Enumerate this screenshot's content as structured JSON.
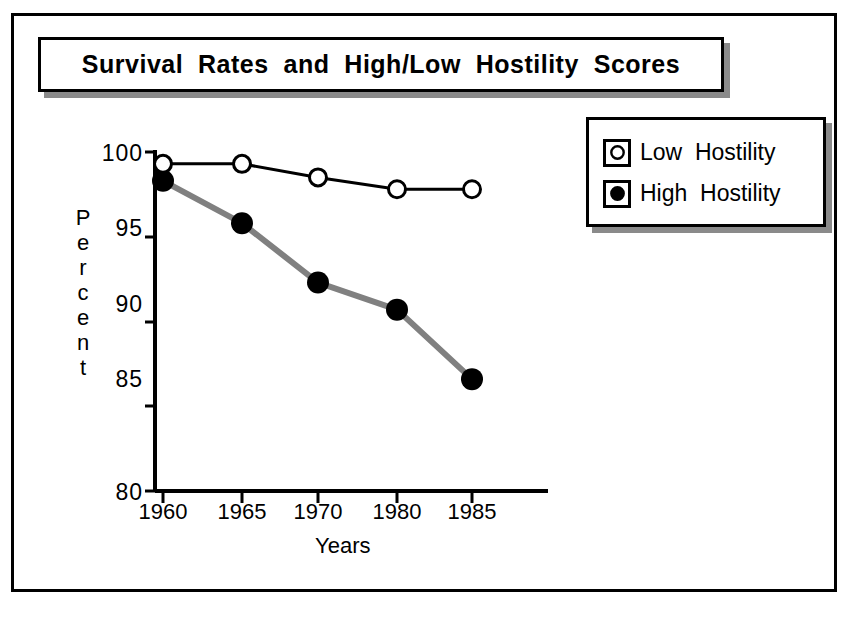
{
  "title": "Survival  Rates  and  High/Low  Hostility  Scores",
  "legend": {
    "items": [
      {
        "label": "Low  Hostility",
        "marker": "open-circle",
        "icon": "open-circle-icon"
      },
      {
        "label": "High  Hostility",
        "marker": "filled-circle",
        "icon": "filled-circle-icon"
      }
    ]
  },
  "axes": {
    "ylabel_letters": [
      "P",
      "e",
      "r",
      "c",
      "e",
      "n",
      "t"
    ],
    "ylabel": "Percent",
    "xlabel": "Years"
  },
  "chart_data": {
    "type": "line",
    "title": "Survival  Rates  and  High/Low  Hostility  Scores",
    "xlabel": "Years",
    "ylabel": "Percent",
    "categories": [
      "1960",
      "1965",
      "1970",
      "1980",
      "1985"
    ],
    "yticks": [
      80,
      85,
      90,
      95,
      100
    ],
    "ylim": [
      80,
      100
    ],
    "grid": false,
    "legend_position": "top-right-outside",
    "series": [
      {
        "name": "Low  Hostility",
        "values": [
          99.3,
          99.3,
          98.5,
          97.8,
          97.8
        ],
        "marker": "open-circle",
        "line_color": "#000000",
        "marker_fill": "#ffffff",
        "marker_edge": "#000000"
      },
      {
        "name": "High  Hostility",
        "values": [
          98.3,
          95.8,
          92.3,
          90.7,
          86.6
        ],
        "marker": "filled-circle",
        "line_color": "#808080",
        "marker_fill": "#000000",
        "marker_edge": "#000000"
      }
    ]
  },
  "colors": {
    "frame": "#000000",
    "shadow": "#8a8a8a",
    "low_line": "#000000",
    "high_line": "#808080",
    "background": "#ffffff"
  }
}
